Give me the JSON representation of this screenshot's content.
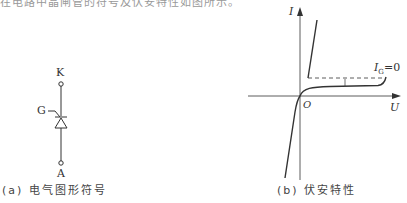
{
  "top_cutoff_text": "在电路中晶闸管的符号及伏安特性如图所示。",
  "symbol": {
    "cathode_label": "K",
    "gate_label": "G",
    "anode_label": "A",
    "caption": "(a) 电气图形符号"
  },
  "characteristic": {
    "y_axis_label": "I",
    "x_axis_label": "U",
    "origin_label": "O",
    "curve_label_main": "I",
    "curve_label_sub": "G",
    "curve_label_value": "=0",
    "caption": "(b) 伏安特性"
  }
}
